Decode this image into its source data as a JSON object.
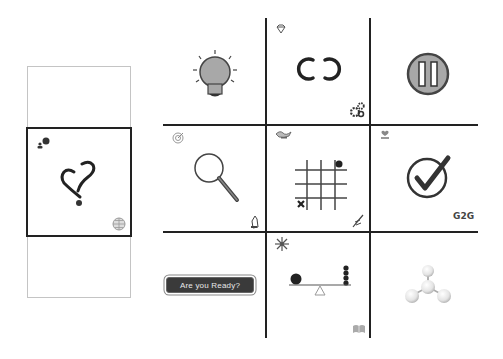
{
  "left_panel": {
    "slots": [
      {
        "state": "empty"
      },
      {
        "state": "selected",
        "center_icon": "heart-question-icon",
        "top_left_icon": "user-hint-icon",
        "bottom_right_icon": "globe-grid-icon"
      },
      {
        "state": "empty"
      }
    ]
  },
  "grid": {
    "cells": [
      {
        "id": "lightbulb",
        "icon": "lightbulb-icon",
        "top_left_icon": "",
        "bottom_right_icon": ""
      },
      {
        "id": "infinity",
        "icon": "infinity-icon",
        "top_left_icon": "diamond-icon",
        "bottom_right_icon": "gears-icon"
      },
      {
        "id": "pause",
        "icon": "pause-icon",
        "top_left_icon": "",
        "bottom_right_icon": ""
      },
      {
        "id": "search",
        "icon": "magnifier-icon",
        "top_left_icon": "target-icon",
        "bottom_right_icon": "hand-icon"
      },
      {
        "id": "tictactoe",
        "icon": "tic-tac-toe-icon",
        "top_left_icon": "genie-lamp-icon",
        "bottom_right_icon": "quill-icon"
      },
      {
        "id": "check",
        "icon": "checkmark-icon",
        "top_left_icon": "heart-hand-icon",
        "bottom_right_text": "G2G"
      },
      {
        "id": "ready",
        "button_label": "Are you Ready?"
      },
      {
        "id": "balance",
        "icon": "seesaw-icon",
        "top_left_icon": "snowflake-icon",
        "bottom_right_icon": "book-icon"
      },
      {
        "id": "molecule",
        "icon": "molecule-icon",
        "top_left_icon": "",
        "bottom_right_icon": ""
      }
    ],
    "g2g_label": "G2G"
  },
  "colors": {
    "line": "#222222",
    "icon_fill": "#a8a8a8",
    "button_bg": "#3a3a3a",
    "button_text": "#e8e8e8",
    "panel_border": "#c4c4c4"
  }
}
